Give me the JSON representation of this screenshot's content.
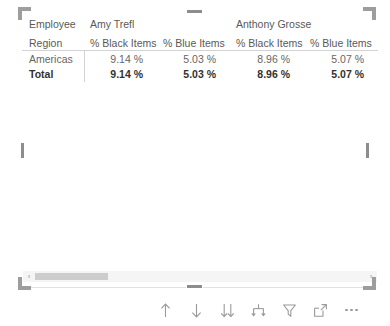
{
  "visual": {
    "type": "matrix-table",
    "selected": true,
    "row_header_label": "Employee",
    "row_field_label": "Region"
  },
  "table": {
    "corner_top_label": "Employee",
    "corner_bottom_label": "Region",
    "column_groups": [
      {
        "name": "Amy Trefl",
        "span": 2
      },
      {
        "name": "Anthony Grosse",
        "span": 2
      }
    ],
    "measure_headers": [
      "% Black Items",
      "% Blue Items",
      "% Black Items",
      "% Blue Items"
    ],
    "rows": [
      {
        "label": "Americas",
        "is_total": false,
        "values": [
          "9.14 %",
          "5.03 %",
          "8.96 %",
          "5.07 %"
        ]
      },
      {
        "label": "Total",
        "is_total": true,
        "values": [
          "9.14 %",
          "5.03 %",
          "8.96 %",
          "5.07 %"
        ]
      }
    ]
  },
  "scrollbar": {
    "orientation": "horizontal",
    "left_arrow": "‹",
    "right_arrow": "›",
    "thumb_position_percent": 0,
    "thumb_width_percent": 22
  },
  "toolbar": {
    "buttons": [
      {
        "name": "drill-up-icon",
        "label": "Drill Up"
      },
      {
        "name": "drill-down-icon",
        "label": "Drill Down"
      },
      {
        "name": "expand-next-level-icon",
        "label": "Go to the next level in the hierarchy"
      },
      {
        "name": "expand-all-down-icon",
        "label": "Expand all down one level in the hierarchy"
      },
      {
        "name": "filter-icon",
        "label": "Filters"
      },
      {
        "name": "focus-mode-icon",
        "label": "Focus mode"
      },
      {
        "name": "more-options-icon",
        "label": "More options"
      }
    ]
  },
  "colors": {
    "text_primary": "#323130",
    "text_secondary": "#595959",
    "text_body": "#666666",
    "rule": "#d3d3d3",
    "handle": "#8d8d8d",
    "corner": "#9d9d9d",
    "scroll_thumb": "#cdcdcd",
    "scroll_track": "#f5f5f5",
    "icon": "#9a9a9a"
  }
}
